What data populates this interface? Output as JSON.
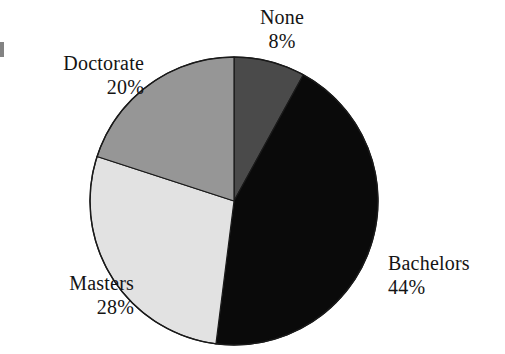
{
  "figure": {
    "background_color": "#ffffff",
    "outline_color": "#1a1a1a",
    "label_text_color": "#141414"
  },
  "chart_data": {
    "type": "pie",
    "title": "",
    "subtitle": "",
    "xlabel": "",
    "ylabel": "",
    "legend_position": "none",
    "grid": false,
    "labels_outside": true,
    "start_angle_deg": 0,
    "direction": "clockwise",
    "center": {
      "x": 234,
      "y": 201
    },
    "radius": 144,
    "categories": [
      "None",
      "Bachelors",
      "Masters",
      "Doctorate"
    ],
    "values": [
      8,
      44,
      28,
      20
    ],
    "value_unit": "%",
    "slices": [
      {
        "label": "None",
        "value": 8,
        "value_text": "8%",
        "color": "#4a4a4a",
        "start_deg": 0,
        "end_deg": 28.8
      },
      {
        "label": "Bachelors",
        "value": 44,
        "value_text": "44%",
        "color": "#0a0a0a",
        "start_deg": 28.8,
        "end_deg": 187.2
      },
      {
        "label": "Masters",
        "value": 28,
        "value_text": "28%",
        "color": "#e2e2e2",
        "start_deg": 187.2,
        "end_deg": 288.0
      },
      {
        "label": "Doctorate",
        "value": 20,
        "value_text": "20%",
        "color": "#969696",
        "start_deg": 288.0,
        "end_deg": 360.0
      }
    ]
  },
  "labels": {
    "none": {
      "name": "None",
      "value": "8%"
    },
    "doctorate": {
      "name": "Doctorate",
      "value": "20%"
    },
    "masters": {
      "name": "Masters",
      "value": "28%"
    },
    "bachelors": {
      "name": "Bachelors",
      "value": "44%"
    }
  }
}
